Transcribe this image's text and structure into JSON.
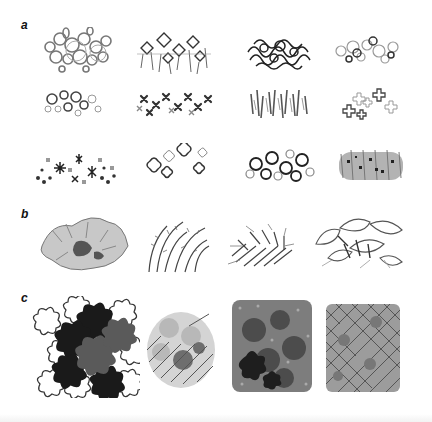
{
  "figure": {
    "panels": [
      {
        "label": "a",
        "rows": 3,
        "columns": 4,
        "items": [
          {
            "id": "a1",
            "style": "loose-circles-teardrops"
          },
          {
            "id": "a2",
            "style": "spiky-stars-with-stems"
          },
          {
            "id": "a3",
            "style": "dense-dark-scribble"
          },
          {
            "id": "a4",
            "style": "scattered-light-circles"
          },
          {
            "id": "a5",
            "style": "small-ring-clusters"
          },
          {
            "id": "a6",
            "style": "dense-cross-flowers"
          },
          {
            "id": "a7",
            "style": "vertical-hatch-strokes"
          },
          {
            "id": "a8",
            "style": "outlined-cross-flowers"
          },
          {
            "id": "a9",
            "style": "asterisks-and-dots"
          },
          {
            "id": "a10",
            "style": "outlined-blossoms"
          },
          {
            "id": "a11",
            "style": "bold-rings-loops"
          },
          {
            "id": "a12",
            "style": "gray-hatch-with-dark-dots"
          }
        ]
      },
      {
        "label": "b",
        "rows": 1,
        "columns": 4,
        "items": [
          {
            "id": "b1",
            "style": "broad-leaf-shaded-clump"
          },
          {
            "id": "b2",
            "style": "arching-grass-fronds"
          },
          {
            "id": "b3",
            "style": "fern-like-dense-clump"
          },
          {
            "id": "b4",
            "style": "large-outlined-leaves"
          }
        ]
      },
      {
        "label": "c",
        "rows": 1,
        "columns": 4,
        "items": [
          {
            "id": "c1",
            "style": "outlined-and-filled-flowers"
          },
          {
            "id": "c2",
            "style": "soft-flowers-over-hatching"
          },
          {
            "id": "c3",
            "style": "dense-speckle-with-dark-flowers"
          },
          {
            "id": "c4",
            "style": "cross-hatched-square-mass"
          }
        ]
      }
    ]
  },
  "colors": {
    "ink_dark": "#222222",
    "ink_mid": "#6a6a6a",
    "ink_light": "#a8a8a8",
    "background": "#ffffff"
  }
}
